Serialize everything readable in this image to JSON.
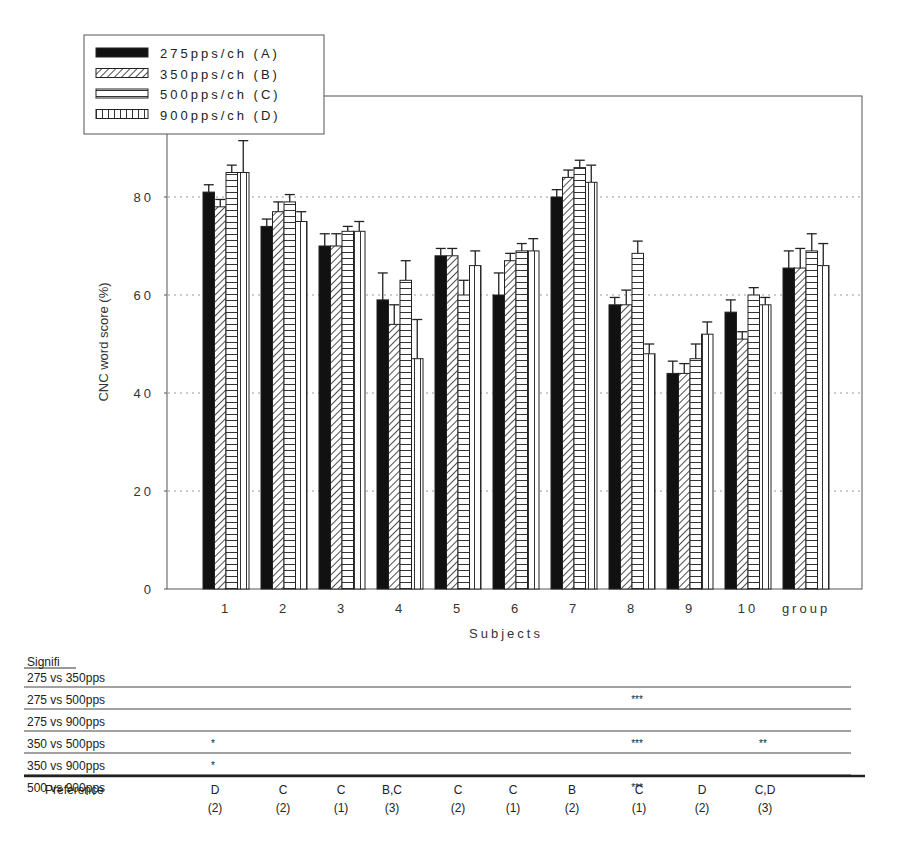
{
  "chart_data": {
    "type": "bar",
    "title": "",
    "xlabel": "Subjects",
    "ylabel": "CNC word score (%)",
    "ylim": [
      0,
      100
    ],
    "yticks": [
      0,
      20,
      40,
      60,
      80
    ],
    "grid": "dotted horizontal at 20, 40, 60, 80",
    "legend_position": "top-left, overlapping plot frame",
    "categories": [
      "1",
      "2",
      "3",
      "4",
      "5",
      "6",
      "7",
      "8",
      "9",
      "10",
      "group"
    ],
    "series": [
      {
        "name": "275pps/ch (A)",
        "pattern": "solid-black",
        "values": [
          81,
          74,
          70,
          59,
          68,
          60,
          80,
          58,
          44,
          56.5,
          65.5
        ],
        "errors": [
          1.5,
          1.5,
          2.5,
          5.5,
          1.5,
          4.5,
          1.5,
          1.5,
          2.5,
          2.5,
          3.5
        ]
      },
      {
        "name": "350pps/ch (B)",
        "pattern": "diagonal-hatch",
        "values": [
          78,
          77,
          70,
          54,
          68,
          67,
          84,
          58,
          44,
          51,
          65.5
        ],
        "errors": [
          1.5,
          2,
          2.5,
          4,
          1.5,
          1.5,
          1.5,
          3,
          2,
          1.5,
          4
        ]
      },
      {
        "name": "500pps/ch (C)",
        "pattern": "horizontal-lines",
        "values": [
          85,
          79,
          73,
          63,
          60,
          69,
          86,
          68.5,
          47,
          60,
          69
        ],
        "errors": [
          1.5,
          1.5,
          1,
          4,
          3,
          1.5,
          1.5,
          2.5,
          3,
          1.5,
          3.5
        ]
      },
      {
        "name": "900pps/ch (D)",
        "pattern": "vertical-lines",
        "values": [
          85,
          75,
          73,
          47,
          66,
          69,
          83,
          48,
          52,
          58,
          66
        ],
        "errors": [
          6.5,
          2,
          2,
          8,
          3,
          2.5,
          3.5,
          2,
          2.5,
          1.5,
          4.5
        ]
      }
    ]
  },
  "legend": {
    "items": [
      {
        "label": "275pps/ch (A)",
        "pattern": "solid"
      },
      {
        "label": "350pps/ch (B)",
        "pattern": "diag"
      },
      {
        "label": "500pps/ch (C)",
        "pattern": "hlines"
      },
      {
        "label": "900pps/ch (D)",
        "pattern": "vlines"
      }
    ]
  },
  "axes": {
    "y_title": "CNC word score (%)",
    "x_title": "Subjects",
    "y_tick_labels": [
      "0",
      "20",
      "40",
      "60",
      "80"
    ],
    "x_tick_labels": [
      "1",
      "2",
      "3",
      "4",
      "5",
      "6",
      "7",
      "8",
      "9",
      "10",
      "group"
    ]
  },
  "table": {
    "header": "Signifi",
    "rows": [
      {
        "label": "275 vs 350pps",
        "marks": [
          "",
          "",
          "",
          "",
          "",
          "",
          "",
          "",
          "",
          ""
        ]
      },
      {
        "label": "275 vs 500pps",
        "marks": [
          "",
          "",
          "",
          "",
          "",
          "",
          "",
          "***",
          "",
          ""
        ]
      },
      {
        "label": "275 vs 900pps",
        "marks": [
          "",
          "",
          "",
          "",
          "",
          "",
          "",
          "",
          "",
          ""
        ]
      },
      {
        "label": "350 vs 500pps",
        "marks": [
          "*",
          "",
          "",
          "",
          "",
          "",
          "",
          "***",
          "",
          "**"
        ]
      },
      {
        "label": "350 vs 900pps",
        "marks": [
          "*",
          "",
          "",
          "",
          "",
          "",
          "",
          "",
          "",
          ""
        ]
      },
      {
        "label": "500 vs 900pps",
        "marks": [
          "",
          "",
          "",
          "",
          "",
          "",
          "",
          "***",
          "",
          ""
        ]
      }
    ],
    "preference_label": "Preference",
    "preference": [
      {
        "choice": "D",
        "count": "(2)"
      },
      {
        "choice": "C",
        "count": "(2)"
      },
      {
        "choice": "C",
        "count": "(1)"
      },
      {
        "choice": "B,C",
        "count": "(3)"
      },
      {
        "choice": "C",
        "count": "(2)"
      },
      {
        "choice": "C",
        "count": "(1)"
      },
      {
        "choice": "B",
        "count": "(2)"
      },
      {
        "choice": "C",
        "count": "(1)"
      },
      {
        "choice": "D",
        "count": "(2)"
      },
      {
        "choice": "C,D",
        "count": "(3)"
      }
    ]
  }
}
